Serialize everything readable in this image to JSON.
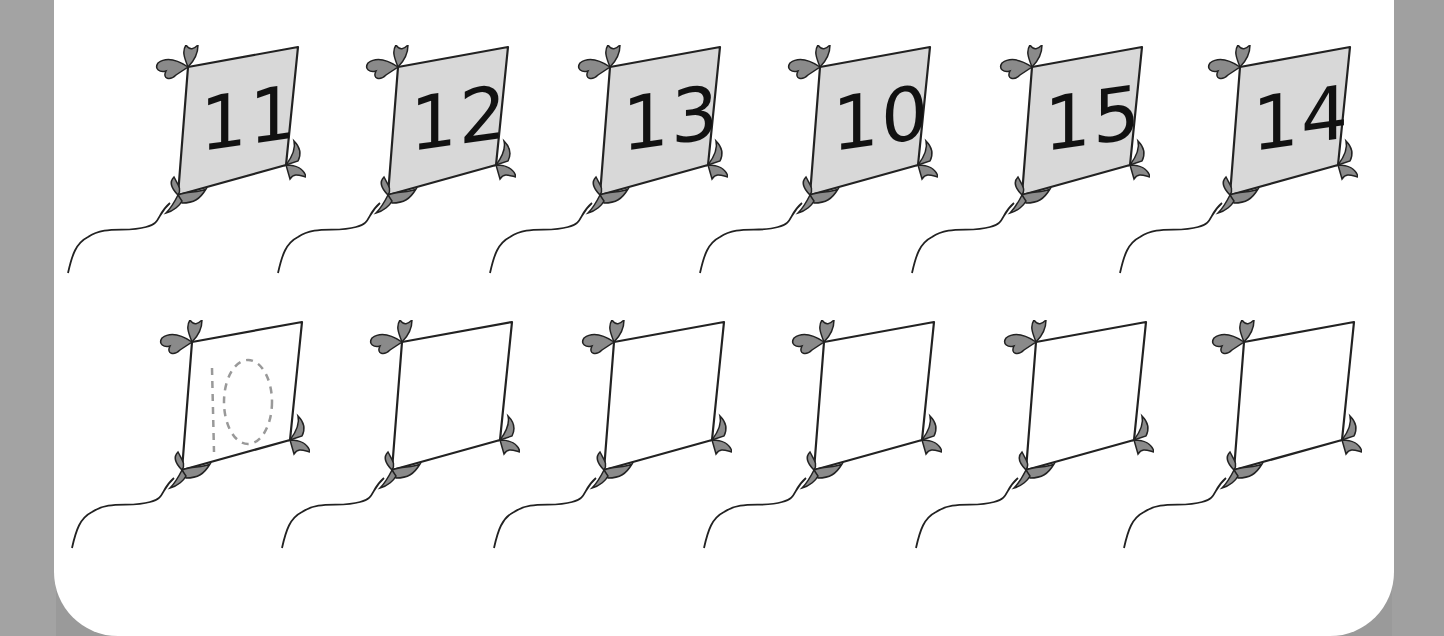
{
  "worksheet": {
    "top_row": {
      "kites": [
        {
          "label": "11"
        },
        {
          "label": "12"
        },
        {
          "label": "13"
        },
        {
          "label": "10"
        },
        {
          "label": "15"
        },
        {
          "label": "14"
        }
      ]
    },
    "bottom_row": {
      "kites": [
        {
          "label": "",
          "trace_hint": "10"
        },
        {
          "label": ""
        },
        {
          "label": ""
        },
        {
          "label": ""
        },
        {
          "label": ""
        },
        {
          "label": ""
        }
      ]
    },
    "colors": {
      "kite_fill_top": "#d8d8d8",
      "kite_fill_bottom": "#ffffff",
      "bow": "#8a8a8a",
      "outline": "#222222",
      "trace": "#999999",
      "frame": "#9a9a9a"
    }
  }
}
